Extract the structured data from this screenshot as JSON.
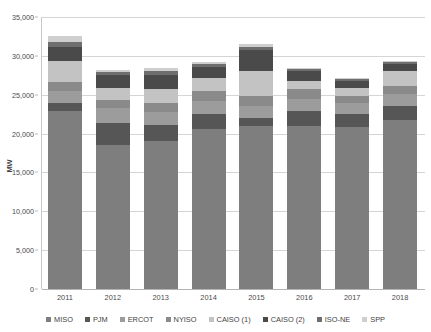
{
  "chart_data": {
    "type": "bar",
    "subtype": "stacked-vertical",
    "title": "",
    "xlabel": "",
    "ylabel": "MW",
    "ylim": [
      0,
      35000
    ],
    "ytick_values": [
      0,
      5000,
      10000,
      15000,
      20000,
      25000,
      30000,
      35000
    ],
    "ytick_labels": [
      "0",
      "5,000",
      "10,000",
      "15,000",
      "20,000",
      "25,000",
      "30,000",
      "35,000"
    ],
    "grid": true,
    "legend_position": "bottom",
    "categories": [
      "2011",
      "2012",
      "2013",
      "2014",
      "2015",
      "2016",
      "2017",
      "2018"
    ],
    "series": [
      {
        "name": "MISO",
        "color": "#7e7e7e",
        "values": [
          22900,
          18500,
          19000,
          20600,
          21000,
          21000,
          20800,
          21800
        ]
      },
      {
        "name": "PJM",
        "color": "#565656",
        "values": [
          1100,
          2800,
          2100,
          1900,
          1000,
          1900,
          1700,
          1700
        ]
      },
      {
        "name": "ERCOT",
        "color": "#9c9c9c",
        "values": [
          1500,
          2000,
          1700,
          1700,
          1600,
          1600,
          1500,
          1600
        ]
      },
      {
        "name": "NYISO",
        "color": "#8a8a8a",
        "values": [
          1200,
          1000,
          1200,
          1300,
          1300,
          1300,
          900,
          1000
        ]
      },
      {
        "name": "CAISO (1)",
        "color": "#c3c3c3",
        "values": [
          2600,
          1600,
          1800,
          1600,
          3100,
          1000,
          1000,
          1900
        ]
      },
      {
        "name": "CAISO (2)",
        "color": "#4a4a4a",
        "values": [
          1900,
          1700,
          1800,
          1500,
          2800,
          1300,
          900,
          1000
        ]
      },
      {
        "name": "ISO-NE",
        "color": "#6e6e6e",
        "values": [
          600,
          300,
          400,
          300,
          400,
          200,
          200,
          200
        ]
      },
      {
        "name": "SPP",
        "color": "#cfcfcf",
        "values": [
          800,
          300,
          400,
          300,
          300,
          200,
          100,
          100
        ]
      }
    ],
    "totals": [
      32600,
      28200,
      28400,
      29200,
      31500,
      28500,
      27100,
      29300
    ]
  },
  "axis": {
    "y_title": "MW"
  },
  "legend": {
    "entries": [
      {
        "label": "MISO"
      },
      {
        "label": "PJM"
      },
      {
        "label": "ERCOT"
      },
      {
        "label": "NYISO"
      },
      {
        "label": "CAISO (1)"
      },
      {
        "label": "CAISO (2)"
      },
      {
        "label": "ISO-NE"
      },
      {
        "label": "SPP"
      }
    ]
  }
}
